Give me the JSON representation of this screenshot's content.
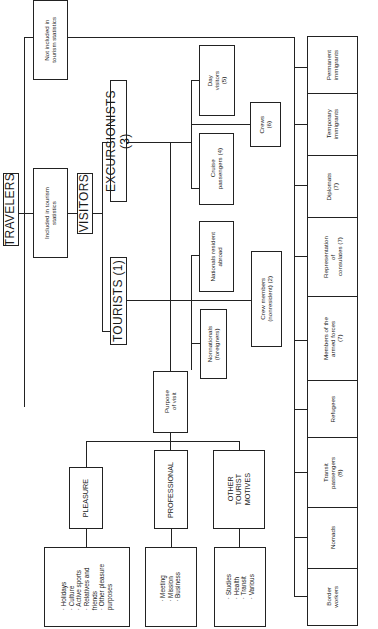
{
  "diagram": {
    "root": "TRAVELERS",
    "included": "Included in tourism\nstatistics",
    "not_included": "Not included in\ntourism statistics",
    "visitors": "VISITORS",
    "tourists": "TOURISTS (1)",
    "excursionists": "EXCURSIONISTS (3)",
    "day_visitors": "Day\nvisitors\n(5)",
    "crews": "Crews\n(6)",
    "cruise_passengers": "Cruise\npassengers (4)",
    "nationals_resident_abroad": "Nationals resident\nabroad",
    "crew_members": "Crew members\n(nonresident) (2)",
    "nonnationals": "Nonnationals\n(foreigners)",
    "purpose_of_visit": "Purpose\nof visit",
    "purposes": [
      {
        "label": "PLEASURE",
        "items": "· Holidays\n· Culture\n· Active sports\n· Relatives and\n  friends\n· Other pleasure\n  purposes"
      },
      {
        "label": "PROFESSIONAL",
        "items": "· Meeting\n· Mission\n· Business"
      },
      {
        "label": "OTHER\nTOURIST\nMOTIVES",
        "items": "· Studies\n· Health\n· Transit\n· Various"
      }
    ],
    "not_included_categories": [
      "Permanent\nimmigrants",
      "Temporary\nimmigrants",
      "Diplomats\n(7)",
      "Representation\nof\nconsulates (7)",
      "Members of the\narmed forces\n(7)",
      "Refugees",
      "Transit\npassengers\n(8)",
      "Nomads",
      "Border\nworkers"
    ]
  }
}
